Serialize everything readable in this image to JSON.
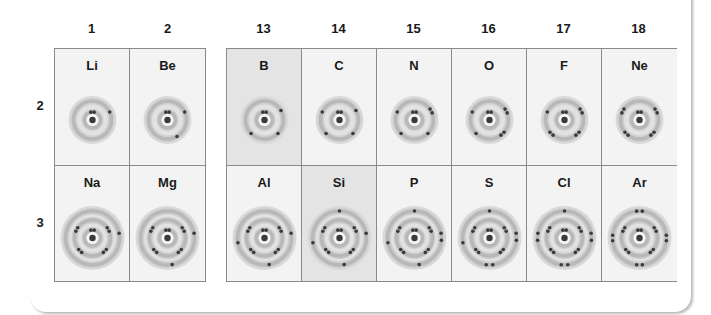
{
  "figure": {
    "groups_left": [
      "1",
      "2"
    ],
    "groups_right": [
      "13",
      "14",
      "15",
      "16",
      "17",
      "18"
    ],
    "periods": [
      "2",
      "3"
    ],
    "colors": {
      "cell_bg": "#f3f3f3",
      "cell_highlight_bg": "#e4e4e4",
      "ring": "#b5b5b5",
      "electron": "#3a3a3a",
      "border": "#8a8a8a"
    },
    "rows": [
      {
        "period": "2",
        "elements": [
          {
            "symbol": "Li",
            "group": "1",
            "shells": [
              2,
              1
            ],
            "highlight": false
          },
          {
            "symbol": "Be",
            "group": "2",
            "shells": [
              2,
              2
            ],
            "highlight": false
          },
          {
            "symbol": "B",
            "group": "13",
            "shells": [
              2,
              3
            ],
            "highlight": true
          },
          {
            "symbol": "C",
            "group": "14",
            "shells": [
              2,
              4
            ],
            "highlight": false
          },
          {
            "symbol": "N",
            "group": "15",
            "shells": [
              2,
              5
            ],
            "highlight": false
          },
          {
            "symbol": "O",
            "group": "16",
            "shells": [
              2,
              6
            ],
            "highlight": false
          },
          {
            "symbol": "F",
            "group": "17",
            "shells": [
              2,
              7
            ],
            "highlight": false
          },
          {
            "symbol": "Ne",
            "group": "18",
            "shells": [
              2,
              8
            ],
            "highlight": false
          }
        ]
      },
      {
        "period": "3",
        "elements": [
          {
            "symbol": "Na",
            "group": "1",
            "shells": [
              2,
              8,
              1
            ],
            "highlight": false
          },
          {
            "symbol": "Mg",
            "group": "2",
            "shells": [
              2,
              8,
              2
            ],
            "highlight": false
          },
          {
            "symbol": "Al",
            "group": "13",
            "shells": [
              2,
              8,
              3
            ],
            "highlight": false
          },
          {
            "symbol": "Si",
            "group": "14",
            "shells": [
              2,
              8,
              4
            ],
            "highlight": true
          },
          {
            "symbol": "P",
            "group": "15",
            "shells": [
              2,
              8,
              5
            ],
            "highlight": false
          },
          {
            "symbol": "S",
            "group": "16",
            "shells": [
              2,
              8,
              6
            ],
            "highlight": false
          },
          {
            "symbol": "Cl",
            "group": "17",
            "shells": [
              2,
              8,
              7
            ],
            "highlight": false
          },
          {
            "symbol": "Ar",
            "group": "18",
            "shells": [
              2,
              8,
              8
            ],
            "highlight": false
          }
        ]
      }
    ]
  }
}
